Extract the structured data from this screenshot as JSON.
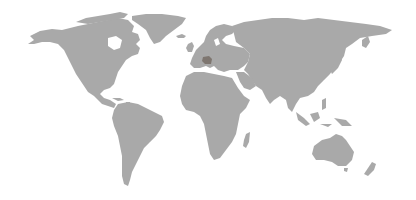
{
  "map": {
    "type": "world-map",
    "projection": "equirectangular-like",
    "land_color": "#a9a9a9",
    "water_color": "#ffffff",
    "highlight_color": "#7e7670",
    "regions": [
      {
        "name": "North America",
        "shape": "north-america"
      },
      {
        "name": "Greenland",
        "shape": "greenland"
      },
      {
        "name": "South America",
        "shape": "south-america"
      },
      {
        "name": "Europe",
        "shape": "europe"
      },
      {
        "name": "Africa",
        "shape": "africa"
      },
      {
        "name": "Madagascar",
        "shape": "madagascar"
      },
      {
        "name": "Asia",
        "shape": "asia"
      },
      {
        "name": "Japan",
        "shape": "japan"
      },
      {
        "name": "Southeast Asia Islands",
        "shape": "sea-islands"
      },
      {
        "name": "Australia",
        "shape": "australia"
      },
      {
        "name": "New Zealand",
        "shape": "new-zealand"
      },
      {
        "name": "United Kingdom",
        "shape": "uk"
      },
      {
        "name": "Iceland",
        "shape": "iceland"
      }
    ],
    "highlighted_region": {
      "approx_location": "Central Europe (Switzerland / Alps)",
      "color": "#7e7670"
    }
  }
}
